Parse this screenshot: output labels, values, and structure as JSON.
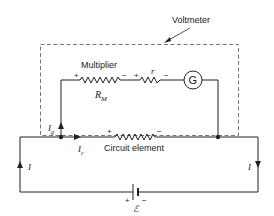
{
  "diagram": {
    "voltmeter_label": "Voltmeter",
    "multiplier_label": "Multiplier",
    "multiplier_symbol": "R",
    "multiplier_subscript": "M",
    "internal_resistance_symbol": "r",
    "galvanometer_symbol": "G",
    "circuit_element_label": "Circuit element",
    "current_total": "I",
    "current_galvanometer": "I",
    "current_galvanometer_subscript": "g",
    "current_circuit": "I",
    "current_circuit_subscript": "c",
    "emf_symbol": "ℰ",
    "plus": "+",
    "minus": "−",
    "colors": {
      "line": "#222222",
      "dashed_box": "#555555",
      "background": "#ffffff"
    }
  }
}
